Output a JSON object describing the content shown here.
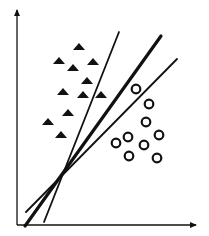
{
  "diagram": {
    "type": "svm-separating-hyperplanes",
    "colors": {
      "background": "#ffffff",
      "ink": "#111111"
    },
    "axes": {
      "y_axis": {
        "x": 17,
        "y_top": 10,
        "y_bottom": 225
      },
      "x_axis": {
        "y": 225,
        "x_left": 17,
        "x_right": 196
      }
    },
    "class_triangles": [
      [
        79,
        47
      ],
      [
        59,
        61
      ],
      [
        93,
        62
      ],
      [
        73,
        68
      ],
      [
        87,
        81
      ],
      [
        63,
        92
      ],
      [
        83,
        95
      ],
      [
        101,
        95
      ],
      [
        68,
        113
      ],
      [
        48,
        122
      ],
      [
        61,
        135
      ]
    ],
    "class_circles": [
      [
        136,
        89
      ],
      [
        149,
        104
      ],
      [
        146,
        122
      ],
      [
        128,
        137
      ],
      [
        159,
        135
      ],
      [
        116,
        143
      ],
      [
        144,
        145
      ],
      [
        129,
        156
      ],
      [
        157,
        158
      ]
    ],
    "lines": [
      {
        "name": "steep",
        "x1": 44,
        "y1": 222,
        "x2": 119,
        "y2": 32,
        "width": 1.8
      },
      {
        "name": "optimal",
        "x1": 25,
        "y1": 226,
        "x2": 161,
        "y2": 36,
        "width": 3.2
      },
      {
        "name": "shallow",
        "x1": 26,
        "y1": 212,
        "x2": 177,
        "y2": 59,
        "width": 1.8
      }
    ]
  }
}
